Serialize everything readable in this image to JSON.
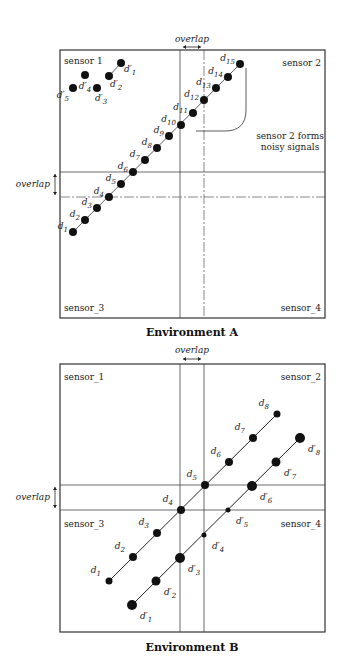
{
  "envA": {
    "caption": "Environment A",
    "box": {
      "x": 60,
      "y": 50,
      "w": 265,
      "h": 268
    },
    "sensors": [
      "sensor 1",
      "sensor 2",
      "sensor_3",
      "sensor_4"
    ],
    "overlap_label_top": "overlap",
    "overlap_label_left": "overlap",
    "note": [
      "sensor 2 forms",
      "noisy signals"
    ],
    "points_d": [
      {
        "id": "d1",
        "x": 73,
        "y": 232
      },
      {
        "id": "d2",
        "x": 85,
        "y": 220
      },
      {
        "id": "d3",
        "x": 97,
        "y": 208
      },
      {
        "id": "d4",
        "x": 109,
        "y": 197
      },
      {
        "id": "d5",
        "x": 121,
        "y": 184
      },
      {
        "id": "d6",
        "x": 133,
        "y": 172
      },
      {
        "id": "d7",
        "x": 145,
        "y": 160
      },
      {
        "id": "d8",
        "x": 157,
        "y": 148
      },
      {
        "id": "d9",
        "x": 169,
        "y": 136
      },
      {
        "id": "d10",
        "x": 181,
        "y": 125
      },
      {
        "id": "d11",
        "x": 193,
        "y": 113
      },
      {
        "id": "d12",
        "x": 204,
        "y": 100
      },
      {
        "id": "d13",
        "x": 216,
        "y": 88
      },
      {
        "id": "d14",
        "x": 228,
        "y": 77
      },
      {
        "id": "d15",
        "x": 240,
        "y": 64
      }
    ],
    "points_dprime": [
      {
        "id": "d'1",
        "x": 121,
        "y": 63
      },
      {
        "id": "d'2",
        "x": 109,
        "y": 76
      },
      {
        "id": "d'3",
        "x": 97,
        "y": 88
      },
      {
        "id": "d'4",
        "x": 85,
        "y": 75
      },
      {
        "id": "d'5",
        "x": 73,
        "y": 88
      }
    ]
  },
  "envB": {
    "caption": "Environment B",
    "box": {
      "x": 60,
      "y": 364,
      "w": 265,
      "h": 268
    },
    "sensors": [
      "sensor_1",
      "sensor_2",
      "sensor_3",
      "sensor_4"
    ],
    "overlap_label_top": "overlap",
    "overlap_label_left": "overlap",
    "points_d": [
      {
        "id": "d1",
        "x": 109,
        "y": 581
      },
      {
        "id": "d2",
        "x": 133,
        "y": 557
      },
      {
        "id": "d3",
        "x": 157,
        "y": 533
      },
      {
        "id": "d4",
        "x": 181,
        "y": 510
      },
      {
        "id": "d5",
        "x": 205,
        "y": 485
      },
      {
        "id": "d6",
        "x": 229,
        "y": 462
      },
      {
        "id": "d7",
        "x": 253,
        "y": 438
      },
      {
        "id": "d8",
        "x": 277,
        "y": 414
      }
    ],
    "points_dprime": [
      {
        "id": "d'1",
        "x": 132,
        "y": 605
      },
      {
        "id": "d'2",
        "x": 156,
        "y": 581
      },
      {
        "id": "d'3",
        "x": 180,
        "y": 558
      },
      {
        "id": "d'4",
        "x": 204,
        "y": 535
      },
      {
        "id": "d'5",
        "x": 228,
        "y": 510
      },
      {
        "id": "d'6",
        "x": 252,
        "y": 486
      },
      {
        "id": "d'7",
        "x": 276,
        "y": 462
      },
      {
        "id": "d'8",
        "x": 300,
        "y": 438
      }
    ]
  }
}
